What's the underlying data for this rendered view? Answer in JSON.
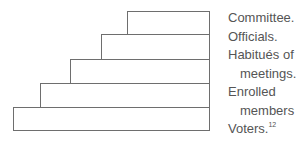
{
  "diagram": {
    "type": "stepped-pyramid",
    "steps": [
      {
        "name": "Committee",
        "left": 127,
        "top": 11,
        "width": 82,
        "height": 23
      },
      {
        "name": "Officials",
        "left": 101,
        "top": 34,
        "width": 108,
        "height": 25
      },
      {
        "name": "Habitues of meetings",
        "left": 70,
        "top": 59,
        "width": 139,
        "height": 24
      },
      {
        "name": "Enrolled members",
        "left": 40,
        "top": 83,
        "width": 169,
        "height": 24
      },
      {
        "name": "Voters",
        "left": 13,
        "top": 107,
        "width": 196,
        "height": 23
      }
    ],
    "border_color": "#6e6e6e",
    "text_color": "#555555"
  },
  "labels": {
    "line1": "Committee.",
    "line2": "Officials.",
    "line3": "Habitués of",
    "line4": "meetings.",
    "line5": "Enrolled",
    "line6": "members",
    "line7": "Voters.",
    "footnote": "12"
  }
}
